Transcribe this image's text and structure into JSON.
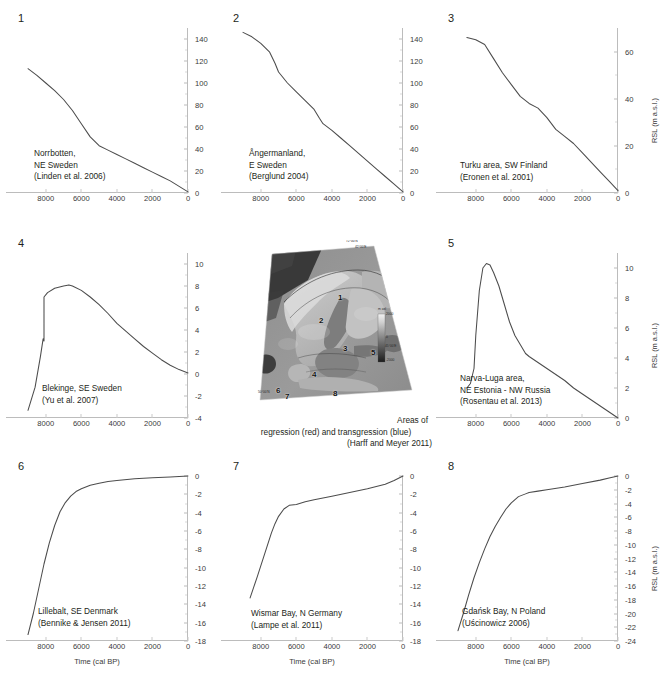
{
  "figure": {
    "panel_count": 8,
    "axis_titles": {
      "x": "Time (cal BP)",
      "y": "RSL (m a.s.l.)"
    }
  },
  "map": {
    "numbers": [
      "1",
      "2",
      "3",
      "4",
      "5",
      "6",
      "7",
      "8"
    ],
    "coord_labels": [
      "72°00'N",
      "42°00'E",
      "45°00'E",
      "50°00'N"
    ],
    "colorbar_labels": [
      "m asl",
      "2000",
      "0",
      "-2000"
    ],
    "caption_line1": "Areas of",
    "caption_line2": "regression (red) and transgression (blue)",
    "caption_line3": "(Harff and Meyer 2011)"
  },
  "bottom_caption": "",
  "panels": [
    {
      "number": "1",
      "caption": [
        "Norrbotten,",
        "NE Sweden",
        "(Linden et al. 2006)"
      ],
      "show_y_axis_title": false,
      "show_x_axis_title": false,
      "chart_data": {
        "type": "line",
        "title": "Norrbotten, NE Sweden",
        "source": "(Linden et al. 2006)",
        "xlabel": "Time (cal BP)",
        "ylabel": "RSL (m a.s.l.)",
        "xlim": [
          9000,
          0
        ],
        "ylim": [
          0,
          150
        ],
        "xticks": [
          8000,
          6000,
          4000,
          2000,
          0
        ],
        "yticks": [
          0,
          20,
          40,
          60,
          80,
          100,
          120,
          140
        ],
        "grid": false,
        "x": [
          9000,
          8500,
          8000,
          7500,
          7000,
          6500,
          6000,
          5500,
          5000,
          4500,
          4000,
          3500,
          3000,
          2500,
          2000,
          1500,
          1000,
          500,
          0
        ],
        "y": [
          113,
          107,
          100,
          93,
          85,
          75,
          63,
          51,
          43,
          39,
          35,
          31,
          27,
          23,
          19,
          15,
          11,
          6,
          1
        ]
      }
    },
    {
      "number": "2",
      "caption": [
        "Ångermanland,",
        "E Sweden",
        "(Berglund 2004)"
      ],
      "show_y_axis_title": false,
      "show_x_axis_title": false,
      "chart_data": {
        "type": "line",
        "title": "Ångermanland, E Sweden",
        "source": "(Berglund 2004)",
        "xlabel": "Time (cal BP)",
        "ylabel": "RSL (m a.s.l.)",
        "xlim": [
          9000,
          0
        ],
        "ylim": [
          0,
          150
        ],
        "xticks": [
          8000,
          6000,
          4000,
          2000,
          0
        ],
        "yticks": [
          0,
          20,
          40,
          60,
          80,
          100,
          120,
          140
        ],
        "grid": false,
        "x": [
          9000,
          8500,
          8000,
          7500,
          7200,
          7000,
          6500,
          6000,
          5500,
          5000,
          4700,
          4500,
          4000,
          3500,
          3000,
          2500,
          2000,
          1500,
          1000,
          500,
          0
        ],
        "y": [
          146,
          142,
          136,
          128,
          118,
          110,
          100,
          92,
          84,
          76,
          68,
          63,
          57,
          50,
          43,
          36,
          29,
          22,
          15,
          8,
          1
        ]
      }
    },
    {
      "number": "3",
      "caption": [
        "Turku area, SW Finland",
        "(Eronen et al. 2001)"
      ],
      "show_y_axis_title": true,
      "show_x_axis_title": false,
      "chart_data": {
        "type": "line",
        "title": "Turku area, SW Finland",
        "source": "(Eronen et al. 2001)",
        "xlabel": "Time (cal BP)",
        "ylabel": "RSL (m a.s.l.)",
        "xlim": [
          9000,
          0
        ],
        "ylim": [
          0,
          70
        ],
        "xticks": [
          8000,
          6000,
          4000,
          2000,
          0
        ],
        "yticks": [
          0,
          20,
          40,
          60
        ],
        "grid": false,
        "x": [
          8500,
          8000,
          7500,
          7000,
          6500,
          6000,
          5500,
          5000,
          4500,
          4000,
          3500,
          3000,
          2500,
          2000,
          1500,
          1000,
          500,
          0
        ],
        "y": [
          66,
          65,
          63,
          57,
          51,
          46,
          41,
          38,
          36,
          32,
          27,
          24,
          21,
          17,
          13,
          9,
          5,
          1
        ]
      }
    },
    {
      "number": "4",
      "caption": [
        "Blekinge, SE Sweden",
        "(Yu et al. 2007)"
      ],
      "show_y_axis_title": false,
      "show_x_axis_title": false,
      "chart_data": {
        "type": "line",
        "title": "Blekinge, SE Sweden",
        "source": "(Yu et al. 2007)",
        "xlabel": "Time (cal BP)",
        "ylabel": "RSL (m a.s.l.)",
        "xlim": [
          9000,
          0
        ],
        "ylim": [
          -4,
          11
        ],
        "xticks": [
          8000,
          6000,
          4000,
          2000,
          0
        ],
        "yticks": [
          -4,
          -2,
          0,
          2,
          4,
          6,
          8,
          10
        ],
        "grid": false,
        "x": [
          9000,
          8600,
          8300,
          8150,
          8100,
          8100,
          7900,
          7500,
          7000,
          6700,
          6500,
          6000,
          5500,
          5000,
          4500,
          4000,
          3500,
          3000,
          2500,
          2000,
          1500,
          1000,
          500,
          0
        ],
        "y": [
          -3.3,
          -1.2,
          1.6,
          3.2,
          3.0,
          7.0,
          7.4,
          7.8,
          8.0,
          8.1,
          8.0,
          7.6,
          7.0,
          6.3,
          5.5,
          4.6,
          3.9,
          3.2,
          2.5,
          1.9,
          1.3,
          0.8,
          0.4,
          0.1
        ]
      }
    },
    {
      "number": "5",
      "caption": [
        "Narva-Luga area,",
        "NE Estonia - NW Russia",
        "(Rosentau et al. 2013)"
      ],
      "show_y_axis_title": true,
      "show_x_axis_title": false,
      "chart_data": {
        "type": "line",
        "title": "Narva-Luga area, NE Estonia - NW Russia",
        "source": "(Rosentau et al. 2013)",
        "xlabel": "Time (cal BP)",
        "ylabel": "RSL (m a.s.l.)",
        "xlim": [
          9000,
          0
        ],
        "ylim": [
          0,
          11
        ],
        "xticks": [
          8000,
          6000,
          4000,
          2000,
          0
        ],
        "yticks": [
          0,
          2,
          4,
          6,
          8,
          10
        ],
        "grid": false,
        "x": [
          8500,
          8300,
          8100,
          8000,
          7800,
          7600,
          7400,
          7200,
          7000,
          6700,
          6400,
          6100,
          5800,
          5500,
          5200,
          5000,
          4500,
          4000,
          3500,
          3000,
          2500,
          2000,
          1500,
          1000,
          500,
          0
        ],
        "y": [
          2.0,
          2.3,
          3.3,
          5.5,
          8.5,
          10.0,
          10.3,
          10.2,
          9.7,
          8.8,
          7.6,
          6.4,
          5.5,
          4.9,
          4.3,
          4.1,
          3.7,
          3.3,
          2.9,
          2.5,
          2.0,
          1.6,
          1.2,
          0.8,
          0.4,
          0.0
        ]
      }
    },
    {
      "number": "6",
      "caption": [
        "Lillebalt, SE Denmark",
        "(Bennike & Jensen 2011)"
      ],
      "show_y_axis_title": false,
      "show_x_axis_title": true,
      "chart_data": {
        "type": "line",
        "title": "Lillebalt, SE Denmark",
        "source": "(Bennike & Jensen 2011)",
        "xlabel": "Time (cal BP)",
        "ylabel": "RSL (m a.s.l.)",
        "xlim": [
          9000,
          0
        ],
        "ylim": [
          -18,
          0
        ],
        "xticks": [
          8000,
          6000,
          4000,
          2000,
          0
        ],
        "yticks": [
          0,
          -2,
          -4,
          -6,
          -8,
          -10,
          -12,
          -14,
          -16,
          -18
        ],
        "grid": false,
        "x": [
          9000,
          8700,
          8400,
          8100,
          7800,
          7500,
          7200,
          6900,
          6600,
          6300,
          6000,
          5500,
          5000,
          4500,
          4000,
          3000,
          2000,
          1000,
          0
        ],
        "y": [
          -17.3,
          -15.0,
          -12.3,
          -9.6,
          -7.3,
          -5.4,
          -3.9,
          -2.9,
          -2.2,
          -1.7,
          -1.4,
          -1.0,
          -0.8,
          -0.6,
          -0.5,
          -0.3,
          -0.2,
          -0.1,
          0.0
        ]
      }
    },
    {
      "number": "7",
      "caption": [
        "Wismar Bay, N Germany",
        "(Lampe et al. 2011)"
      ],
      "show_y_axis_title": false,
      "show_x_axis_title": true,
      "chart_data": {
        "type": "line",
        "title": "Wismar Bay, N Germany",
        "source": "(Lampe et al. 2011)",
        "xlabel": "Time (cal BP)",
        "ylabel": "RSL (m a.s.l.)",
        "xlim": [
          9000,
          0
        ],
        "ylim": [
          -18,
          0
        ],
        "xticks": [
          8000,
          6000,
          4000,
          2000,
          0
        ],
        "yticks": [
          0,
          -2,
          -4,
          -6,
          -8,
          -10,
          -12,
          -14,
          -16,
          -18
        ],
        "grid": false,
        "x": [
          8600,
          8200,
          7800,
          7400,
          7200,
          7000,
          6700,
          6400,
          6000,
          5500,
          5000,
          4000,
          3000,
          2000,
          1000,
          500,
          0
        ],
        "y": [
          -13.3,
          -11.0,
          -8.6,
          -6.2,
          -5.2,
          -4.4,
          -3.6,
          -3.2,
          -3.1,
          -2.8,
          -2.6,
          -2.2,
          -1.8,
          -1.4,
          -0.9,
          -0.5,
          0.0
        ]
      }
    },
    {
      "number": "8",
      "caption": [
        "Gdańsk Bay, N Poland",
        "(Uścinowicz 2006)"
      ],
      "show_y_axis_title": true,
      "show_x_axis_title": true,
      "chart_data": {
        "type": "line",
        "title": "Gdańsk Bay, N Poland",
        "source": "(Uścinowicz 2006)",
        "xlabel": "Time (cal BP)",
        "ylabel": "RSL (m a.s.l.)",
        "xlim": [
          9000,
          0
        ],
        "ylim": [
          -24,
          0
        ],
        "xticks": [
          8000,
          6000,
          4000,
          2000,
          0
        ],
        "yticks": [
          0,
          -2,
          -4,
          -6,
          -8,
          -10,
          -12,
          -14,
          -16,
          -18,
          -20,
          -22,
          -24
        ],
        "grid": false,
        "x": [
          9000,
          8700,
          8400,
          8100,
          7800,
          7500,
          7200,
          6900,
          6600,
          6300,
          6000,
          5600,
          5200,
          5000,
          4500,
          4000,
          3000,
          2000,
          1000,
          500,
          0
        ],
        "y": [
          -22.5,
          -20.0,
          -17.3,
          -14.8,
          -12.6,
          -10.6,
          -8.8,
          -7.3,
          -6.0,
          -4.8,
          -3.9,
          -3.0,
          -2.6,
          -2.4,
          -2.2,
          -2.0,
          -1.6,
          -1.1,
          -0.6,
          -0.3,
          0.0
        ]
      }
    }
  ]
}
